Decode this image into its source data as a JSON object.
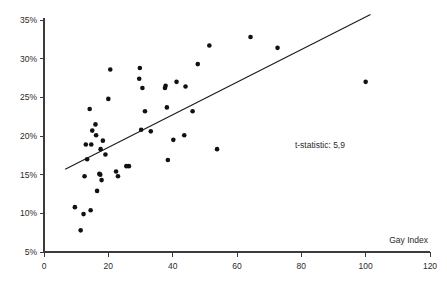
{
  "chart_data": {
    "type": "scatter",
    "title": "",
    "subtitle": "",
    "xlabel": "Gay Index",
    "ylabel": "",
    "xlim": [
      0,
      120
    ],
    "ylim": [
      5,
      35
    ],
    "grid": false,
    "legend": null,
    "x_ticks": [
      0,
      20,
      40,
      60,
      80,
      100,
      120
    ],
    "x_tick_labels": [
      "0",
      "20",
      "40",
      "60",
      "80",
      "100",
      "120"
    ],
    "y_ticks": [
      5,
      10,
      15,
      20,
      25,
      30,
      35
    ],
    "y_tick_labels": [
      "5%",
      "10%",
      "15%",
      "20%",
      "25%",
      "30%",
      "35%"
    ],
    "annotations": [
      {
        "name": "t-statistic-annotation",
        "text": "t-statistic: 5,9",
        "x": 78,
        "y": 18.4
      }
    ],
    "series": [
      {
        "name": "observations",
        "marker": "filled-circle",
        "color": "#111111",
        "points": [
          [
            9.6,
            10.8
          ],
          [
            11.4,
            7.8
          ],
          [
            12.3,
            9.9
          ],
          [
            12.6,
            14.8
          ],
          [
            13.0,
            18.9
          ],
          [
            13.4,
            17.0
          ],
          [
            14.2,
            23.5
          ],
          [
            14.5,
            10.4
          ],
          [
            14.7,
            18.9
          ],
          [
            15.0,
            20.7
          ],
          [
            16.0,
            21.5
          ],
          [
            16.2,
            20.1
          ],
          [
            16.5,
            12.9
          ],
          [
            17.2,
            15.1
          ],
          [
            17.5,
            15.0
          ],
          [
            17.6,
            18.3
          ],
          [
            17.9,
            14.3
          ],
          [
            18.3,
            19.4
          ],
          [
            19.1,
            17.6
          ],
          [
            20.0,
            24.8
          ],
          [
            20.6,
            28.6
          ],
          [
            22.4,
            15.4
          ],
          [
            23.0,
            14.8
          ],
          [
            25.6,
            16.1
          ],
          [
            26.4,
            16.1
          ],
          [
            29.6,
            27.4
          ],
          [
            29.8,
            28.8
          ],
          [
            30.2,
            20.8
          ],
          [
            30.6,
            26.2
          ],
          [
            31.4,
            23.2
          ],
          [
            33.2,
            20.6
          ],
          [
            37.6,
            26.2
          ],
          [
            37.8,
            26.5
          ],
          [
            38.2,
            23.7
          ],
          [
            38.5,
            16.9
          ],
          [
            40.2,
            19.5
          ],
          [
            41.2,
            27.0
          ],
          [
            43.6,
            20.1
          ],
          [
            44.0,
            26.4
          ],
          [
            46.2,
            23.2
          ],
          [
            47.8,
            29.3
          ],
          [
            51.4,
            31.7
          ],
          [
            53.8,
            18.3
          ],
          [
            64.2,
            32.8
          ],
          [
            72.6,
            31.4
          ],
          [
            100.0,
            27.0
          ]
        ]
      }
    ],
    "trend_line": {
      "name": "regression-line",
      "x_start": 6.6,
      "y_start": 15.7,
      "x_end": 101.5,
      "y_end": 35.7,
      "color": "#1a1a1a"
    }
  }
}
